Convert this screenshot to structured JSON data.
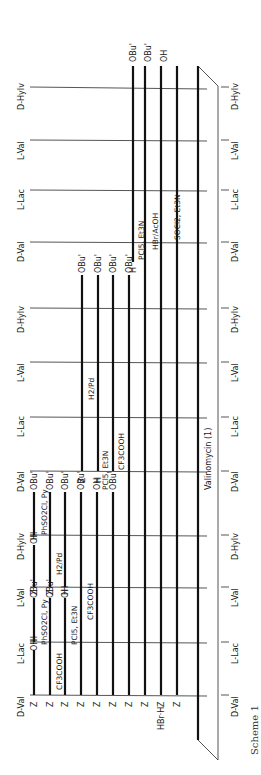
{
  "caption": "Scheme 1",
  "product_label": "Valinomycin (1)",
  "residues_top": [
    "D-Val",
    "L-Lac",
    "L-Val",
    "D-HyIv",
    "D-Val",
    "L-Lac",
    "L-Val",
    "D-HyIv",
    "D-Val",
    "L-Lac",
    "L-Val",
    "D-HyIv"
  ],
  "residues_bottom": [
    "D-Val",
    "L-Lac",
    "L-Val",
    "D-HyIv",
    "D-Val",
    "L-Lac",
    "L-Val",
    "D-HyIv",
    "D-Val",
    "L-Lac",
    "L-Val",
    "D-HyIv"
  ],
  "row1": {
    "a_left": "Z",
    "a_right": "OH",
    "b_left": "H",
    "b_right": "OBu'",
    "c_left": "Z",
    "c_right": "OH",
    "d_left": "H",
    "d_right": "OBu'",
    "reagent_ab": "PhSO2Cl, Py",
    "reagent_cd": "PhSO2Cl, Py"
  },
  "row2": {
    "a_left": "Z",
    "a_right": "OBu'",
    "b_left": "Z",
    "b_right": "OBu'",
    "reagent_a": "CF3COOH",
    "reagent_b": "H2/Pd"
  },
  "row3": {
    "a_left": "Z",
    "a_right": "OH",
    "b_left": "H",
    "b_right": "OBu'",
    "reagent": "PCl5, Et3N"
  },
  "row4": {
    "left": "Z",
    "right": "OBu'",
    "reagent": "CF3COOH"
  },
  "row5": {
    "left": "Z",
    "right": "OH",
    "reagent_right_fragment": "PCl5, Et3N",
    "b_left": "Z",
    "b_right": "OBu'",
    "reagent_h2": "H2/Pd"
  },
  "row6": {
    "left": "Z",
    "right": "OBu'",
    "b_left": "H",
    "reagent": "CF3COOH"
  },
  "rows_long": [
    {
      "left": "Z",
      "right": "OBu'"
    },
    {
      "left": "Z",
      "right": "OBu'"
    },
    {
      "left": "Z",
      "right": "OBu'"
    },
    {
      "left": "Z",
      "right": "OH",
      "b_left": "H",
      "reagent": "PCl5, Et3N"
    },
    {
      "left": "Z",
      "right": "OBu'",
      "reagent": "HBr/AcOH"
    },
    {
      "left": "HBr·H",
      "right": "OH",
      "reagent": "SOCl2, Et3N"
    }
  ],
  "top_right_labels": [
    "OBu'",
    "OBu'",
    "OH"
  ]
}
